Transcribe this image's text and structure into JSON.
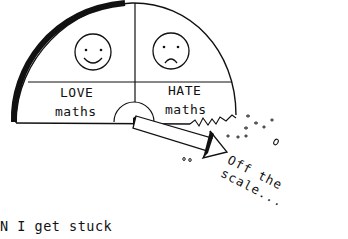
{
  "gauge": {
    "left_label_line1": "LOVE",
    "left_label_line2": "maths",
    "right_label_line1": "HATE",
    "right_label_line2": "maths",
    "left_face": "happy-face",
    "right_face": "sad-face"
  },
  "pointer_caption": "Off the scale...",
  "bottom_caption": "N I get stuck"
}
